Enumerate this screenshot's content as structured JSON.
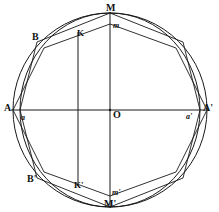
{
  "figure": {
    "background_color": "#ffffff",
    "stroke_color": "#1a1a1a",
    "geometry": {
      "center": {
        "x": 110,
        "y": 110
      },
      "circle_radius_x": 97,
      "circle_radius_y": 97,
      "ellipse_radius_x": 90,
      "ellipse_radius_y": 97,
      "chord_x": 78,
      "chord_top_y": 32,
      "chord_bottom_y": 186
    },
    "labels": [
      {
        "id": "M",
        "text": "M",
        "style": "bold",
        "x": 106,
        "y": 3,
        "desc": "top-vertex-label"
      },
      {
        "id": "m",
        "text": "m",
        "style": "ital",
        "x": 113,
        "y": 22,
        "desc": "top-inner-point-label"
      },
      {
        "id": "B",
        "text": "B",
        "style": "bold",
        "x": 32,
        "y": 32,
        "desc": "upper-left-vertex-label"
      },
      {
        "id": "K",
        "text": "K",
        "style": "plain",
        "x": 77,
        "y": 29,
        "desc": "chord-top-label"
      },
      {
        "id": "A",
        "text": "A",
        "style": "bold",
        "x": 4,
        "y": 103,
        "desc": "left-axis-endpoint-label"
      },
      {
        "id": "a",
        "text": "a",
        "style": "ital",
        "x": 21,
        "y": 114,
        "desc": "left-inner-point-label"
      },
      {
        "id": "O",
        "text": "O",
        "style": "bold",
        "x": 113,
        "y": 110,
        "desc": "center-label"
      },
      {
        "id": "aprime",
        "text": "a'",
        "style": "ital",
        "x": 186,
        "y": 113,
        "desc": "right-inner-point-label"
      },
      {
        "id": "Aprime",
        "text": "A'",
        "style": "bold",
        "x": 203,
        "y": 103,
        "desc": "right-axis-endpoint-label"
      },
      {
        "id": "Bprime",
        "text": "B'",
        "style": "bold",
        "x": 27,
        "y": 174,
        "desc": "lower-left-vertex-label"
      },
      {
        "id": "Kprime",
        "text": "K'",
        "style": "plain",
        "x": 74,
        "y": 181,
        "desc": "chord-bottom-label"
      },
      {
        "id": "mprime",
        "text": "m'",
        "style": "ital",
        "x": 112,
        "y": 189,
        "desc": "bottom-inner-point-label"
      },
      {
        "id": "Mprime",
        "text": "M'",
        "style": "bold",
        "x": 104,
        "y": 199,
        "desc": "bottom-vertex-label"
      }
    ],
    "polygon_vertices": [
      {
        "name": "M",
        "x": 110,
        "y": 13
      },
      {
        "name": "B2",
        "x": 183,
        "y": 42
      },
      {
        "name": "a'",
        "x": 200,
        "y": 110
      },
      {
        "name": "B2p",
        "x": 183,
        "y": 178
      },
      {
        "name": "M'",
        "x": 110,
        "y": 207
      },
      {
        "name": "B'",
        "x": 37,
        "y": 178
      },
      {
        "name": "a",
        "x": 20,
        "y": 110
      },
      {
        "name": "B",
        "x": 37,
        "y": 42
      }
    ],
    "inner_polygon_vertices": [
      {
        "name": "m",
        "x": 110,
        "y": 24
      },
      {
        "name": "c2",
        "x": 176,
        "y": 48
      },
      {
        "name": "A'",
        "x": 207,
        "y": 110
      },
      {
        "name": "c3",
        "x": 176,
        "y": 172
      },
      {
        "name": "m'",
        "x": 110,
        "y": 196
      },
      {
        "name": "c4",
        "x": 44,
        "y": 172
      },
      {
        "name": "A",
        "x": 13,
        "y": 110
      },
      {
        "name": "c1",
        "x": 44,
        "y": 48
      }
    ]
  }
}
